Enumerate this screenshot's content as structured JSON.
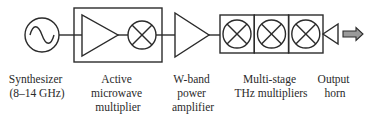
{
  "diagram": {
    "colors": {
      "line": "#2b2b2b",
      "text": "#2a2a2a",
      "arrow_fill": "#9a9a9a",
      "background": "#ffffff"
    },
    "blocks": [
      {
        "id": "synthesizer",
        "symbol": "sine-source-icon",
        "label_lines": [
          "Synthesizer",
          "(8–14 GHz)"
        ]
      },
      {
        "id": "active-multiplier",
        "symbol": "amplifier-and-mixer-box",
        "label_lines": [
          "Active",
          "microwave",
          "multiplier"
        ]
      },
      {
        "id": "w-band-amplifier",
        "symbol": "amplifier-triangle-icon",
        "label_lines": [
          "W-band",
          "power",
          "amplifier"
        ]
      },
      {
        "id": "thz-multipliers",
        "symbol": "triple-multiplier-box",
        "label_lines": [
          "Multi-stage",
          "THz multipliers"
        ]
      },
      {
        "id": "output-horn",
        "symbol": "horn-antenna-icon",
        "label_lines": [
          "Output",
          "horn"
        ]
      }
    ],
    "output_arrow": "output-arrow-icon"
  }
}
